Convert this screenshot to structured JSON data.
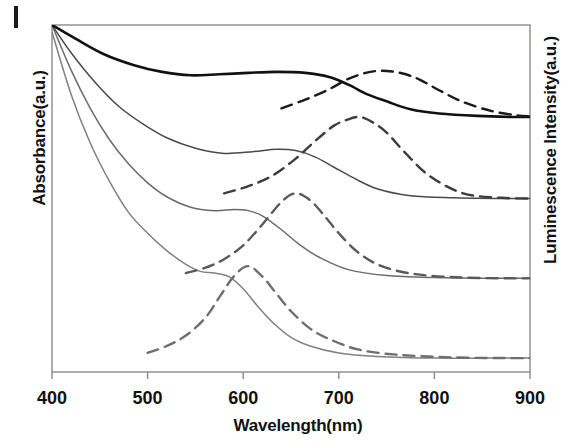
{
  "figure": {
    "xlabel": "Wavelength(nm)",
    "ylabel_left": "Absorbance(a.u.)",
    "ylabel_right": "Luminescence Intensity(a.u.)"
  },
  "chart_data": {
    "type": "line",
    "title": "",
    "xlabel": "Wavelength(nm)",
    "ylabel": "Absorbance(a.u.)",
    "ylabel_secondary": "Luminescence Intensity(a.u.)",
    "xlim": [
      400,
      900
    ],
    "xticks": [
      400,
      500,
      600,
      700,
      800,
      900
    ],
    "xtick_labels": [
      "400",
      "500",
      "600",
      "700",
      "800",
      "900"
    ],
    "ylim": [
      0,
      1
    ],
    "yticks": [],
    "ytick_labels": [],
    "grid": false,
    "legend": "none",
    "series": [
      {
        "name": "Absorbance 1 (smallest)",
        "style": "solid",
        "color": "#808080",
        "offset": 0.04,
        "shoulder_nm": 570,
        "emission_pair": "Emission 1",
        "x": [
          400,
          420,
          440,
          460,
          480,
          500,
          520,
          540,
          555,
          570,
          585,
          600,
          615,
          630,
          650,
          670,
          700,
          740,
          800,
          860,
          900
        ],
        "y": [
          0.98,
          0.8,
          0.66,
          0.55,
          0.46,
          0.4,
          0.35,
          0.31,
          0.29,
          0.285,
          0.275,
          0.24,
          0.19,
          0.145,
          0.1,
          0.075,
          0.055,
          0.045,
          0.04,
          0.04,
          0.04
        ]
      },
      {
        "name": "Emission 1 (smallest)",
        "style": "dashed",
        "color": "#6e6e6e",
        "offset": 0.04,
        "peak_nm": 605,
        "x": [
          500,
          520,
          540,
          560,
          575,
          590,
          605,
          620,
          635,
          650,
          670,
          690,
          720,
          760,
          820,
          880,
          900
        ],
        "y": [
          0.055,
          0.075,
          0.105,
          0.155,
          0.215,
          0.275,
          0.305,
          0.275,
          0.225,
          0.175,
          0.125,
          0.095,
          0.065,
          0.05,
          0.042,
          0.04,
          0.04
        ]
      },
      {
        "name": "Absorbance 2",
        "style": "solid",
        "color": "#6b6b6b",
        "offset": 0.27,
        "shoulder_nm": 600,
        "emission_pair": "Emission 2",
        "x": [
          400,
          420,
          440,
          460,
          480,
          500,
          520,
          545,
          570,
          590,
          605,
          620,
          640,
          660,
          680,
          710,
          750,
          800,
          860,
          900
        ],
        "y": [
          1.0,
          0.87,
          0.76,
          0.67,
          0.6,
          0.545,
          0.505,
          0.475,
          0.465,
          0.468,
          0.465,
          0.45,
          0.41,
          0.365,
          0.33,
          0.295,
          0.278,
          0.272,
          0.27,
          0.27
        ]
      },
      {
        "name": "Emission 2",
        "style": "dashed",
        "color": "#5a5a5a",
        "offset": 0.27,
        "peak_nm": 660,
        "x": [
          540,
          560,
          580,
          600,
          620,
          640,
          655,
          670,
          685,
          700,
          720,
          745,
          780,
          830,
          880,
          900
        ],
        "y": [
          0.285,
          0.3,
          0.325,
          0.365,
          0.425,
          0.49,
          0.515,
          0.495,
          0.45,
          0.4,
          0.345,
          0.305,
          0.282,
          0.272,
          0.27,
          0.27
        ]
      },
      {
        "name": "Absorbance 3",
        "style": "solid",
        "color": "#4a4a4a",
        "offset": 0.5,
        "shoulder_nm": 640,
        "emission_pair": "Emission 3",
        "x": [
          400,
          420,
          445,
          470,
          495,
          520,
          550,
          580,
          610,
          635,
          655,
          675,
          695,
          715,
          740,
          775,
          820,
          870,
          900
        ],
        "y": [
          1.0,
          0.92,
          0.835,
          0.765,
          0.715,
          0.675,
          0.645,
          0.63,
          0.635,
          0.642,
          0.638,
          0.62,
          0.59,
          0.56,
          0.528,
          0.508,
          0.502,
          0.5,
          0.5
        ]
      },
      {
        "name": "Emission 3",
        "style": "dashed",
        "color": "#3d3d3d",
        "offset": 0.5,
        "peak_nm": 720,
        "x": [
          580,
          605,
          630,
          655,
          675,
          695,
          710,
          722,
          735,
          750,
          770,
          795,
          830,
          870,
          900
        ],
        "y": [
          0.515,
          0.535,
          0.565,
          0.615,
          0.665,
          0.71,
          0.728,
          0.735,
          0.72,
          0.69,
          0.63,
          0.565,
          0.515,
          0.502,
          0.5
        ]
      },
      {
        "name": "Absorbance 4 (largest)",
        "style": "solid",
        "color": "#111111",
        "offset": 0.735,
        "shoulder_nm": 690,
        "emission_pair": "Emission 4",
        "x": [
          400,
          425,
          455,
          485,
          515,
          545,
          575,
          605,
          635,
          665,
          690,
          710,
          730,
          750,
          775,
          805,
          845,
          880,
          900
        ],
        "y": [
          1.0,
          0.96,
          0.915,
          0.885,
          0.865,
          0.855,
          0.858,
          0.862,
          0.865,
          0.862,
          0.85,
          0.828,
          0.8,
          0.78,
          0.757,
          0.745,
          0.738,
          0.735,
          0.735
        ]
      },
      {
        "name": "Emission 4 (largest)",
        "style": "dashed",
        "color": "#1a1a1a",
        "offset": 0.735,
        "peak_nm": 755,
        "x": [
          640,
          665,
          690,
          710,
          728,
          742,
          756,
          770,
          785,
          805,
          830,
          860,
          885,
          900
        ],
        "y": [
          0.76,
          0.785,
          0.815,
          0.845,
          0.862,
          0.868,
          0.866,
          0.858,
          0.842,
          0.812,
          0.778,
          0.752,
          0.74,
          0.737
        ]
      }
    ]
  }
}
